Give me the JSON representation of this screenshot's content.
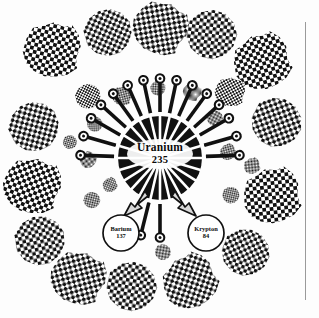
{
  "figure": {
    "background_color": "#fdfdfd",
    "ink_color": "#111111",
    "frame_rule_color": "#9a9a9a"
  },
  "nucleus": {
    "element": "Uranium",
    "mass_number": "235",
    "center": {
      "x": 160,
      "y": 158
    },
    "radius": 42,
    "style": "black disc with radial white sunburst spokes",
    "spoke_count": 22
  },
  "products": [
    {
      "id": "barium",
      "element": "Barium",
      "mass_number": "137",
      "center": {
        "x": 121,
        "y": 233
      },
      "radius": 18
    },
    {
      "id": "krypton",
      "element": "Krypton",
      "mass_number": "84",
      "center": {
        "x": 206,
        "y": 233
      },
      "radius": 18
    }
  ],
  "fission_arrows": [
    {
      "to": "barium",
      "angle_deg": 118,
      "style": "thick-tapered-outline"
    },
    {
      "to": "krypton",
      "angle_deg": 62,
      "style": "thick-tapered-outline"
    }
  ],
  "neutrons": {
    "count": 17,
    "head_shape": "circle",
    "description": "ball-tipped arrows radiating outward from the nucleus",
    "angles_deg": [
      182,
      196,
      210,
      222,
      234,
      246,
      258,
      270,
      282,
      294,
      306,
      318,
      330,
      344,
      358,
      90,
      104
    ]
  },
  "fragment_blobs": {
    "pattern": "checkerboard halftone",
    "outer_ring_count": 16,
    "inner_ring_count": 14,
    "description": "irregular checker-patterned fission fragment clouds"
  },
  "legend": {
    "caption": ""
  }
}
